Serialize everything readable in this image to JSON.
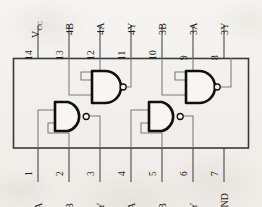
{
  "diagram": {
    "package": "DIP-14",
    "ink_color": "#1a1a1a",
    "wire_color": "#6b6b6b",
    "paper_color": "#f2f0ec"
  },
  "top_pins": [
    {
      "number": "14",
      "name": "V",
      "subscript": "CC"
    },
    {
      "number": "13",
      "name": "4B",
      "subscript": ""
    },
    {
      "number": "12",
      "name": "4A",
      "subscript": ""
    },
    {
      "number": "11",
      "name": "4Y",
      "subscript": ""
    },
    {
      "number": "10",
      "name": "3B",
      "subscript": ""
    },
    {
      "number": "9",
      "name": "3A",
      "subscript": ""
    },
    {
      "number": "8",
      "name": "3Y",
      "subscript": ""
    }
  ],
  "bottom_pins": [
    {
      "number": "1",
      "name": "1A"
    },
    {
      "number": "2",
      "name": "1B"
    },
    {
      "number": "3",
      "name": "1Y"
    },
    {
      "number": "4",
      "name": "2A"
    },
    {
      "number": "5",
      "name": "2B"
    },
    {
      "number": "6",
      "name": "2Y"
    },
    {
      "number": "7",
      "name": "GND"
    }
  ],
  "gates": [
    {
      "id": "gate-1",
      "type": "NAND",
      "inputs": [
        "1A",
        "1B"
      ],
      "output": "1Y"
    },
    {
      "id": "gate-2",
      "type": "NAND",
      "inputs": [
        "2A",
        "2B"
      ],
      "output": "2Y"
    },
    {
      "id": "gate-3",
      "type": "NAND",
      "inputs": [
        "3A",
        "3B"
      ],
      "output": "3Y"
    },
    {
      "id": "gate-4",
      "type": "NAND",
      "inputs": [
        "4A",
        "4B"
      ],
      "output": "4Y"
    }
  ]
}
